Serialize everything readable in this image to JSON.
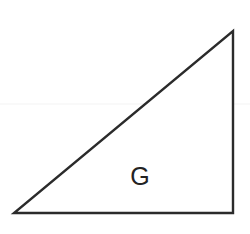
{
  "figure": {
    "canvas": {
      "width": 250,
      "height": 234,
      "background": "#ffffff"
    },
    "shape": {
      "kind": "right triangle",
      "label": "G",
      "label_position": {
        "x": 140,
        "y": 185
      },
      "stroke_color": "#2b2b2b",
      "stroke_width": 2.4,
      "fill_color": "#ffffff",
      "vertices": [
        {
          "name": "bottom-left",
          "x": 14,
          "y": 213
        },
        {
          "name": "bottom-right",
          "x": 233,
          "y": 213
        },
        {
          "name": "top-right",
          "x": 233,
          "y": 31
        }
      ],
      "edges": [
        {
          "name": "base",
          "from": "bottom-left",
          "to": "bottom-right"
        },
        {
          "name": "vertical-leg",
          "from": "bottom-right",
          "to": "top-right"
        },
        {
          "name": "hypotenuse",
          "from": "top-right",
          "to": "bottom-left"
        }
      ],
      "right_angle_at": "bottom-right"
    },
    "artifact_line": {
      "name": "faint-horizontal-scan-line",
      "y": 104,
      "color": "#f3f3f3",
      "thickness": 1
    }
  }
}
